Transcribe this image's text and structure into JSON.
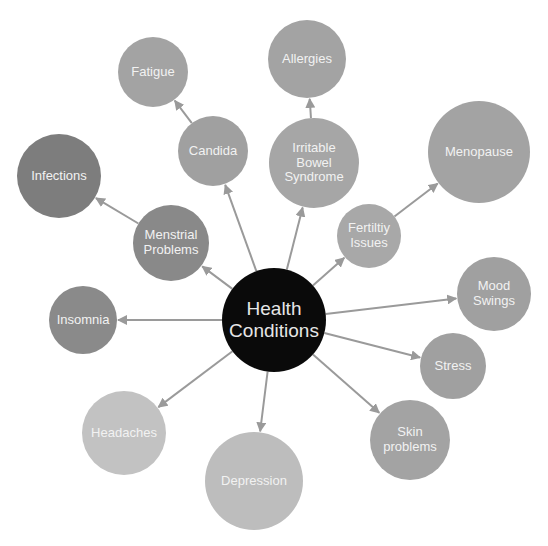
{
  "center": {
    "label_lines": [
      "Health",
      "Conditions"
    ],
    "x": 274,
    "y": 320,
    "r": 52,
    "color": "#0a0a0a",
    "text_color": "#e6e6e6",
    "font_size": 19
  },
  "nodes": [
    {
      "id": "fatigue",
      "label_lines": [
        "Fatigue"
      ],
      "x": 153,
      "y": 72,
      "r": 35,
      "color": "#a3a3a3",
      "font_size": 13
    },
    {
      "id": "candida",
      "label_lines": [
        "Candida"
      ],
      "x": 213,
      "y": 151,
      "r": 35,
      "color": "#a0a0a0",
      "font_size": 13
    },
    {
      "id": "infections",
      "label_lines": [
        "Infections"
      ],
      "x": 59,
      "y": 176,
      "r": 42,
      "color": "#7d7d7d",
      "font_size": 13
    },
    {
      "id": "menstrial-problems",
      "label_lines": [
        "Menstrial",
        "Problems"
      ],
      "x": 171,
      "y": 243,
      "r": 38,
      "color": "#898989",
      "font_size": 13
    },
    {
      "id": "insomnia",
      "label_lines": [
        "Insomnia"
      ],
      "x": 83,
      "y": 320,
      "r": 34,
      "color": "#8a8a8a",
      "font_size": 13
    },
    {
      "id": "headaches",
      "label_lines": [
        "Headaches"
      ],
      "x": 124,
      "y": 433,
      "r": 42,
      "color": "#c2c2c2",
      "font_size": 13
    },
    {
      "id": "depression",
      "label_lines": [
        "Depression"
      ],
      "x": 254,
      "y": 481,
      "r": 49,
      "color": "#bdbdbd",
      "font_size": 13
    },
    {
      "id": "allergies",
      "label_lines": [
        "Allergies"
      ],
      "x": 307,
      "y": 59,
      "r": 39,
      "color": "#a3a3a3",
      "font_size": 13
    },
    {
      "id": "irritable-bowel-syndrome",
      "label_lines": [
        "Irritable",
        "Bowel",
        "Syndrome"
      ],
      "x": 314,
      "y": 163,
      "r": 45,
      "color": "#a6a6a6",
      "font_size": 13
    },
    {
      "id": "menopause",
      "label_lines": [
        "Menopause"
      ],
      "x": 479,
      "y": 152,
      "r": 51,
      "color": "#a3a3a3",
      "font_size": 13
    },
    {
      "id": "fertility-issues",
      "label_lines": [
        "Fertiltiy",
        "Issues"
      ],
      "x": 369,
      "y": 236,
      "r": 32,
      "color": "#a8a8a8",
      "font_size": 13
    },
    {
      "id": "mood-swings",
      "label_lines": [
        "Mood",
        "Swings"
      ],
      "x": 494,
      "y": 294,
      "r": 37,
      "color": "#a0a0a0",
      "font_size": 13
    },
    {
      "id": "stress",
      "label_lines": [
        "Stress"
      ],
      "x": 453,
      "y": 366,
      "r": 33,
      "color": "#a0a0a0",
      "font_size": 13
    },
    {
      "id": "skin-problems",
      "label_lines": [
        "Skin",
        "problems"
      ],
      "x": 410,
      "y": 440,
      "r": 40,
      "color": "#a3a3a3",
      "font_size": 13
    }
  ],
  "edges": [
    {
      "from": "center",
      "to": "candida"
    },
    {
      "from": "center",
      "to": "irritable-bowel-syndrome"
    },
    {
      "from": "center",
      "to": "menstrial-problems"
    },
    {
      "from": "center",
      "to": "fertility-issues"
    },
    {
      "from": "center",
      "to": "insomnia"
    },
    {
      "from": "center",
      "to": "headaches"
    },
    {
      "from": "center",
      "to": "depression"
    },
    {
      "from": "center",
      "to": "mood-swings"
    },
    {
      "from": "center",
      "to": "stress"
    },
    {
      "from": "center",
      "to": "skin-problems"
    },
    {
      "from": "candida",
      "to": "fatigue"
    },
    {
      "from": "irritable-bowel-syndrome",
      "to": "allergies"
    },
    {
      "from": "menstrial-problems",
      "to": "infections"
    },
    {
      "from": "fertility-issues",
      "to": "menopause"
    }
  ],
  "edge_color": "#9a9a9a"
}
